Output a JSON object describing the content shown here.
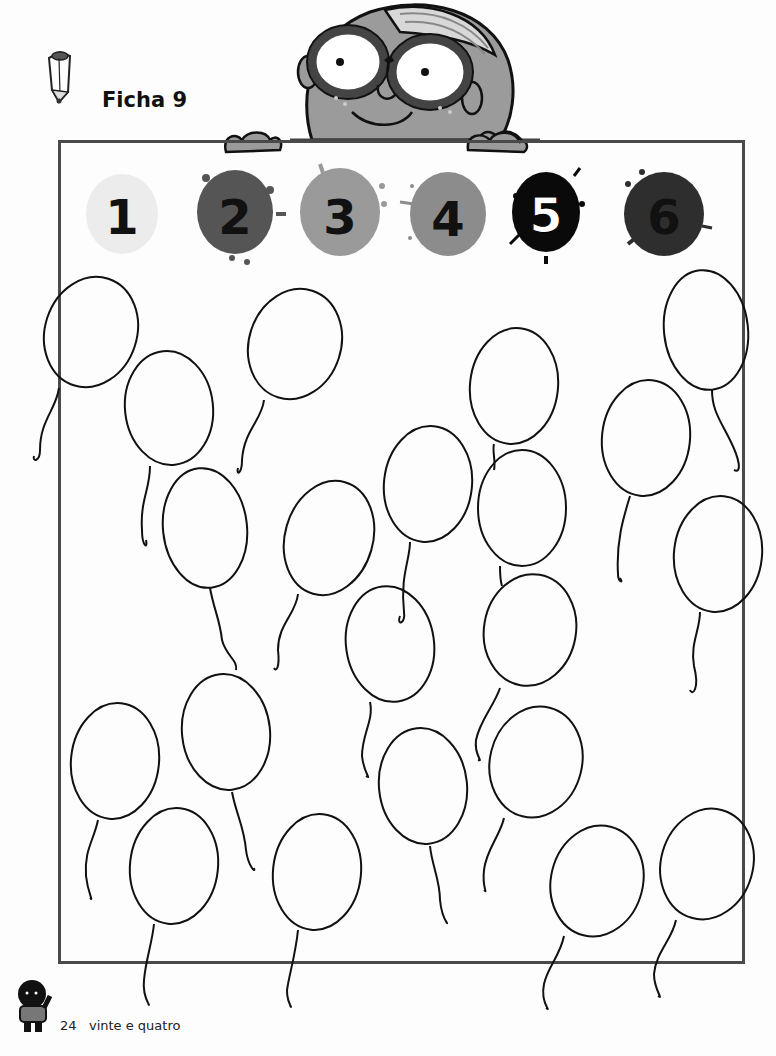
{
  "header": {
    "title": "Ficha 9"
  },
  "numbers": [
    {
      "label": "1",
      "splat_color": "#ececec",
      "text_color": "#111111"
    },
    {
      "label": "2",
      "splat_color": "#555555",
      "text_color": "#111111"
    },
    {
      "label": "3",
      "splat_color": "#9a9a9a",
      "text_color": "#111111"
    },
    {
      "label": "4",
      "splat_color": "#8c8c8c",
      "text_color": "#111111"
    },
    {
      "label": "5",
      "splat_color": "#0a0a0a",
      "text_color": "#ffffff"
    },
    {
      "label": "6",
      "splat_color": "#2e2e2e",
      "text_color": "#111111"
    }
  ],
  "balloon_count": 24,
  "footer": {
    "page_number": "24",
    "page_words": "vinte e quatro"
  }
}
